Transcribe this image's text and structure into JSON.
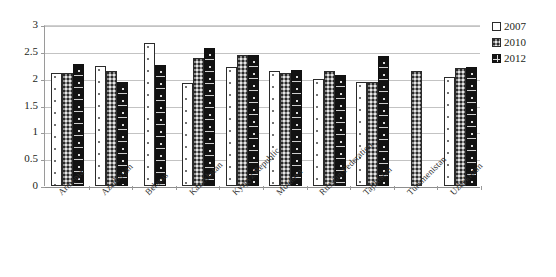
{
  "chart_data": {
    "type": "bar",
    "title": "",
    "xlabel": "",
    "ylabel": "",
    "ylim": [
      0,
      3
    ],
    "ytick_labels": [
      "0",
      "0.5",
      "1",
      "1.5",
      "2",
      "2.5",
      "3"
    ],
    "ytick_values": [
      0,
      0.5,
      1,
      1.5,
      2,
      2.5,
      3
    ],
    "grid": true,
    "legend_position": "right",
    "categories": [
      "Armenia",
      "Azerbaijan",
      "Belarus",
      "Kazakhstan",
      "Kyrgyz Republic",
      "Moldova",
      "Russian Federation",
      "Tajikistan",
      "Turkmenistan",
      "Uzbekistan"
    ],
    "series": [
      {
        "name": "2007",
        "color": "#ffffff",
        "values": [
          2.11,
          2.24,
          2.67,
          1.92,
          2.21,
          2.15,
          2.0,
          1.93,
          null,
          2.04
        ]
      },
      {
        "name": "2010",
        "color": "#8e8e8e",
        "values": [
          2.11,
          2.15,
          null,
          2.38,
          2.45,
          2.1,
          2.15,
          1.93,
          2.15,
          2.2
        ]
      },
      {
        "name": "2012",
        "color": "#121212",
        "values": [
          2.28,
          1.93,
          2.25,
          2.58,
          2.45,
          2.17,
          2.06,
          2.43,
          null,
          2.22
        ]
      }
    ]
  },
  "legend": {
    "items": [
      {
        "label": "2007"
      },
      {
        "label": "2010"
      },
      {
        "label": "2012"
      }
    ]
  }
}
